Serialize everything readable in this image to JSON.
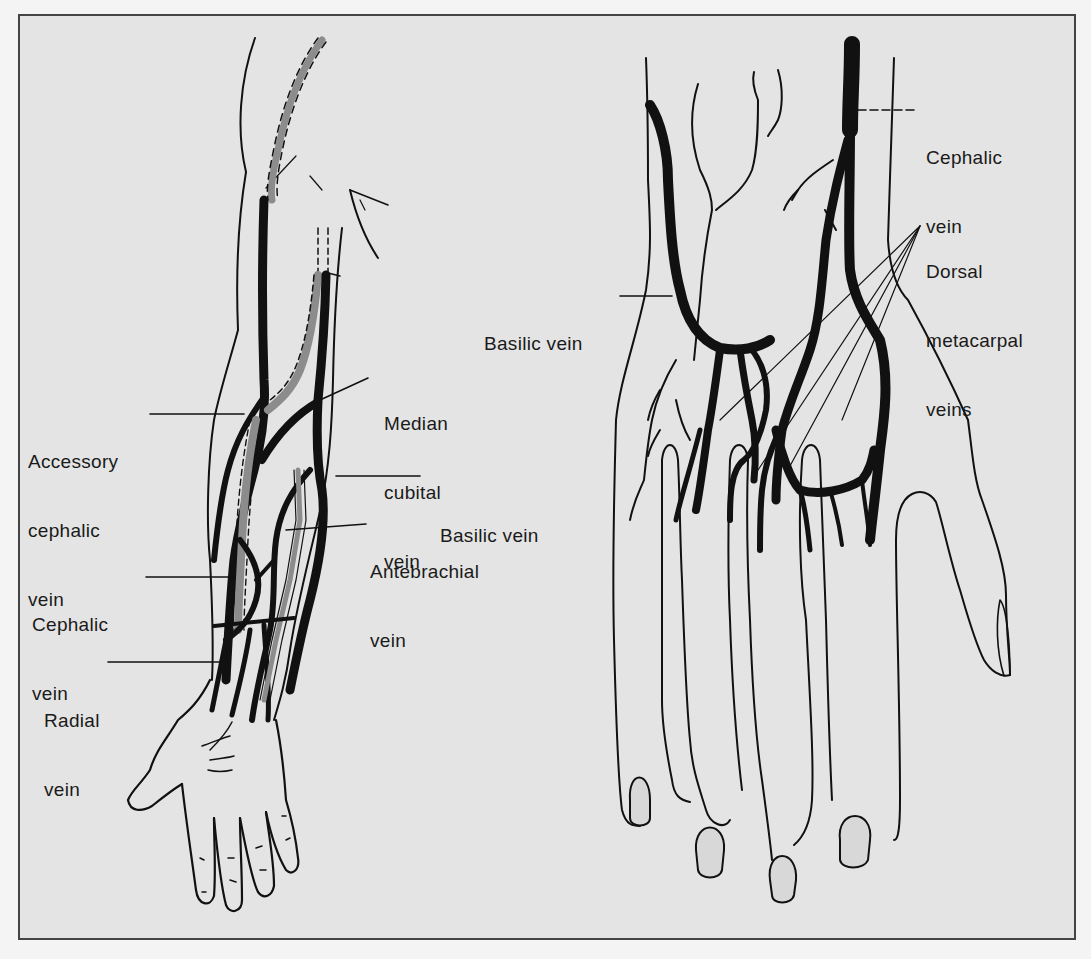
{
  "figure": {
    "background": "#e4e4e4",
    "border_color": "#444444",
    "vein_color": "#111111",
    "deep_vein_color": "#8c8c8c"
  },
  "left_panel": {
    "view": "forearm",
    "labels": {
      "accessory_cephalic": [
        "Accessory",
        "cephalic",
        "vein"
      ],
      "median_cubital": [
        "Median",
        "cubital",
        "vein"
      ],
      "basilic": [
        "Basilic vein"
      ],
      "antebrachial": [
        "Antebrachial",
        "vein"
      ],
      "cephalic": [
        "Cephalic",
        "vein"
      ],
      "radial": [
        "Radial",
        "vein"
      ]
    }
  },
  "right_panel": {
    "view": "dorsum-of-hand",
    "labels": {
      "cephalic": [
        "Cephalic",
        "vein"
      ],
      "dorsal_metacarpal": [
        "Dorsal",
        "metacarpal",
        "veins"
      ],
      "basilic": [
        "Basilic vein"
      ]
    }
  }
}
